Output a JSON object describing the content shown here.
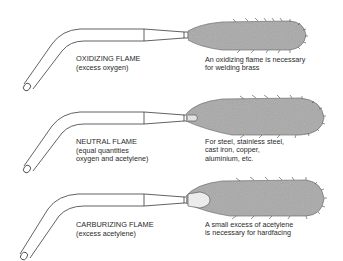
{
  "flames": [
    {
      "id": "oxidizing",
      "title": "OXIDIZING FLAME",
      "subtitle": "(excess oxygen)",
      "description": "An oxidizing flame is necessary\nfor welding brass",
      "inner_cone": "short"
    },
    {
      "id": "neutral",
      "title": "NEUTRAL FLAME",
      "subtitle": "(equal quantities\noxygen and acetylene)",
      "description": "For steel, stainless steel,\ncast iron, copper,\naluminium, etc.",
      "inner_cone": "medium"
    },
    {
      "id": "carburizing",
      "title": "CARBURIZING FLAME",
      "subtitle": "(excess acetylene)",
      "description": "A small excess of acetylene\nis necessary for hardfacing",
      "inner_cone": "feathered"
    }
  ],
  "colors": {
    "flame_fill": "#a9a9a9",
    "outline": "#3a3a3a",
    "background": "#ffffff"
  }
}
